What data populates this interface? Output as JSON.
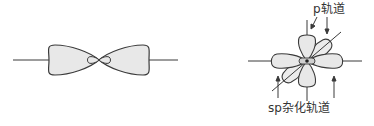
{
  "figures": [
    {
      "id": "s-orbital-hybrid-single",
      "description": "single sp hybrid orbital: large lobe pair along horizontal axis with small inner lobes"
    },
    {
      "id": "sp-hybrid-with-p",
      "labels": {
        "p_orbital": "p轨道",
        "sp_hybrid": "sp杂化轨道"
      }
    }
  ],
  "colors": {
    "stroke": "#3a3a3a",
    "lobe_fill": "#e8e8e8",
    "background": "#ffffff"
  }
}
